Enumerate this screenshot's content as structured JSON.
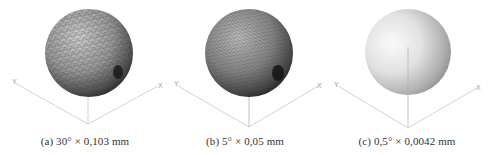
{
  "figure": {
    "panels": [
      {
        "id": "a",
        "caption": "(a) 30° × 0,103 mm",
        "angle_deg": "30°",
        "chord_mm": "0,103 mm",
        "mesh": "coarse",
        "axis_labels": {
          "x": "X",
          "y": "Y"
        }
      },
      {
        "id": "b",
        "caption": "(b) 5° × 0,05 mm",
        "angle_deg": "5°",
        "chord_mm": "0,05 mm",
        "mesh": "fine",
        "axis_labels": {
          "x": "X",
          "y": "Y"
        }
      },
      {
        "id": "c",
        "caption": "(c) 0,5° × 0,0042 mm",
        "angle_deg": "0,5°",
        "chord_mm": "0,0042 mm",
        "mesh": "smooth",
        "axis_labels": {
          "x": "X",
          "y": "Y",
          "z": "Z"
        }
      }
    ],
    "colors": {
      "background": "#ffffff",
      "axis_line": "#c8c8c8",
      "caption_text": "#333333",
      "mesh_sphere_light": "#bdbdbd",
      "mesh_sphere_dark": "#2a2a2a",
      "smooth_sphere_light": "#f7f7f7",
      "smooth_sphere_dark": "#8a8a8a"
    }
  }
}
